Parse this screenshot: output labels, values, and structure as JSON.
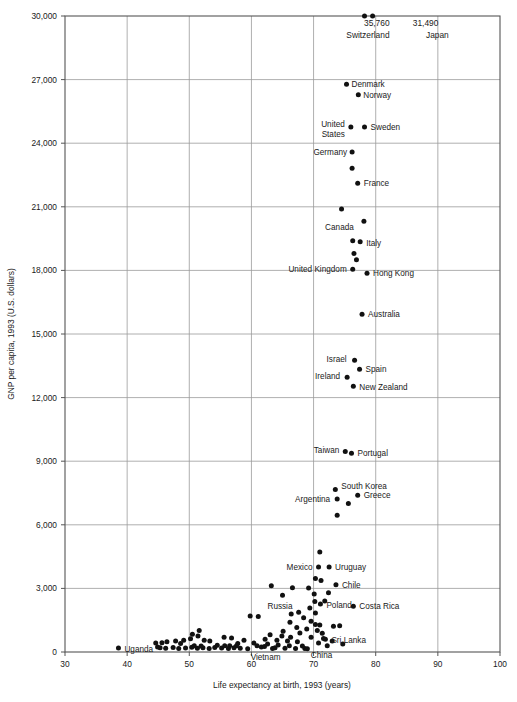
{
  "chart_data": {
    "type": "scatter",
    "title": "",
    "xlabel": "Life expectancy at birth, 1993 (years)",
    "ylabel": "GNP per capita, 1993 (U.S. dollars)",
    "xlim": [
      30,
      100
    ],
    "ylim": [
      0,
      30000
    ],
    "xticks": [
      "30",
      "40",
      "50",
      "60",
      "70",
      "80",
      "90",
      "100"
    ],
    "xtick_values": [
      30,
      40,
      50,
      60,
      70,
      80,
      90,
      100
    ],
    "yticks": [
      "0",
      "3,000",
      "6,000",
      "9,000",
      "12,000",
      "15,000",
      "18,000",
      "21,000",
      "24,000",
      "27,000",
      "30,000"
    ],
    "ytick_values": [
      0,
      3000,
      6000,
      9000,
      12000,
      15000,
      18000,
      21000,
      24000,
      27000,
      30000
    ],
    "grid": true,
    "legend": "none",
    "annotations": [
      {
        "text": "35,760",
        "x": 83.2,
        "y": 30000,
        "anchor": "end",
        "dx": -6,
        "dy": 10
      },
      {
        "text": "Switzerland",
        "x": 83.2,
        "y": 30000,
        "anchor": "end",
        "dx": -6,
        "dy": 22
      },
      {
        "text": "31,490",
        "x": 85.0,
        "y": 30000,
        "anchor": "start",
        "dx": 6,
        "dy": 10
      },
      {
        "text": "Japan",
        "x": 85.0,
        "y": 30000,
        "anchor": "end",
        "dx": 42,
        "dy": 22
      }
    ],
    "labeled_points": [
      {
        "name": "Switzerland",
        "x": 78.2,
        "y": 30000,
        "value": 35760,
        "label": "",
        "anchor": "end",
        "dx": 0,
        "dy": 0
      },
      {
        "name": "Japan",
        "x": 79.5,
        "y": 30000,
        "value": 31490,
        "label": "",
        "anchor": "end",
        "dx": 0,
        "dy": 0
      },
      {
        "name": "Denmark",
        "x": 75.3,
        "y": 26780,
        "label": "Denmark",
        "anchor": "start",
        "dx": 5,
        "dy": 3
      },
      {
        "name": "Norway",
        "x": 77.2,
        "y": 26290,
        "label": "Norway",
        "anchor": "start",
        "dx": 5,
        "dy": 3
      },
      {
        "name": "United States",
        "x": 76.0,
        "y": 24760,
        "label": "United",
        "anchor": "end",
        "dx": -6,
        "dy": 0,
        "label2": "States",
        "dy2": 10
      },
      {
        "name": "Sweden",
        "x": 78.2,
        "y": 24760,
        "label": "Sweden",
        "anchor": "start",
        "dx": 6,
        "dy": 3
      },
      {
        "name": "Germany",
        "x": 76.2,
        "y": 23580,
        "label": "Germany",
        "anchor": "end",
        "dx": -5,
        "dy": 3
      },
      {
        "name": "Germany2",
        "x": 76.2,
        "y": 22820,
        "label": "",
        "anchor": "start",
        "dx": 0,
        "dy": 0
      },
      {
        "name": "France",
        "x": 77.1,
        "y": 22110,
        "label": "France",
        "anchor": "start",
        "dx": 6,
        "dy": 3
      },
      {
        "name": "Unlabeled-21k",
        "x": 74.5,
        "y": 20900,
        "label": "",
        "anchor": "start",
        "dx": 0,
        "dy": 0
      },
      {
        "name": "Unlabeled-20.3k",
        "x": 78.1,
        "y": 20320,
        "label": "",
        "anchor": "start",
        "dx": 0,
        "dy": 0
      },
      {
        "name": "Canada",
        "x": 77.6,
        "y": 19900,
        "label": "Canada",
        "anchor": "end",
        "dx": -7,
        "dy": 0
      },
      {
        "name": "Italy",
        "x": 77.5,
        "y": 19350,
        "label": "Italy",
        "anchor": "start",
        "dx": 6,
        "dy": 4
      },
      {
        "name": "Unlabeled-19.4k",
        "x": 76.3,
        "y": 19400,
        "label": "",
        "anchor": "start",
        "dx": 0,
        "dy": 0
      },
      {
        "name": "Unlabeled-18.9k",
        "x": 76.5,
        "y": 18800,
        "label": "",
        "anchor": "start",
        "dx": 0,
        "dy": 0
      },
      {
        "name": "Unlabeled-18.5k",
        "x": 76.9,
        "y": 18500,
        "label": "",
        "anchor": "start",
        "dx": 0,
        "dy": 0
      },
      {
        "name": "United Kingdom",
        "x": 76.3,
        "y": 18060,
        "label": "United Kingdom",
        "anchor": "end",
        "dx": -6,
        "dy": 3
      },
      {
        "name": "Hong Kong",
        "x": 78.6,
        "y": 17860,
        "label": "Hong Kong",
        "anchor": "start",
        "dx": 6,
        "dy": 3
      },
      {
        "name": "Australia",
        "x": 77.8,
        "y": 15930,
        "label": "Australia",
        "anchor": "start",
        "dx": 6,
        "dy": 3
      },
      {
        "name": "Israel",
        "x": 76.6,
        "y": 13760,
        "label": "Israel",
        "anchor": "end",
        "dx": -8,
        "dy": 2
      },
      {
        "name": "Spain",
        "x": 77.4,
        "y": 13340,
        "label": "Spain",
        "anchor": "start",
        "dx": 6,
        "dy": 3
      },
      {
        "name": "Ireland",
        "x": 75.4,
        "y": 12960,
        "label": "Ireland",
        "anchor": "end",
        "dx": -7,
        "dy": 2
      },
      {
        "name": "New Zealand",
        "x": 76.4,
        "y": 12540,
        "label": "New Zealand",
        "anchor": "start",
        "dx": 6,
        "dy": 4
      },
      {
        "name": "Taiwan",
        "x": 75.1,
        "y": 9460,
        "label": "Taiwan",
        "anchor": "end",
        "dx": -6,
        "dy": 2
      },
      {
        "name": "Portugal",
        "x": 76.1,
        "y": 9370,
        "label": "Portugal",
        "anchor": "start",
        "dx": 6,
        "dy": 3
      },
      {
        "name": "South Korea",
        "x": 73.5,
        "y": 7660,
        "label": "South Korea",
        "anchor": "start",
        "dx": 6,
        "dy": -1
      },
      {
        "name": "Argentina",
        "x": 73.8,
        "y": 7220,
        "label": "Argentina",
        "anchor": "end",
        "dx": -7,
        "dy": 3
      },
      {
        "name": "Greece",
        "x": 77.1,
        "y": 7390,
        "label": "Greece",
        "anchor": "start",
        "dx": 6,
        "dy": 3
      },
      {
        "name": "Unlabeled-7.0k",
        "x": 75.6,
        "y": 7000,
        "label": "",
        "anchor": "start",
        "dx": 0,
        "dy": 0
      },
      {
        "name": "Unlabeled-6.4k",
        "x": 73.8,
        "y": 6450,
        "label": "",
        "anchor": "start",
        "dx": 0,
        "dy": 0
      },
      {
        "name": "Unlabeled-4.7k",
        "x": 71.0,
        "y": 4720,
        "label": "",
        "anchor": "start",
        "dx": 0,
        "dy": 0
      },
      {
        "name": "Mexico",
        "x": 70.8,
        "y": 4010,
        "label": "Mexico",
        "anchor": "end",
        "dx": -6,
        "dy": 3
      },
      {
        "name": "Uruguay",
        "x": 72.5,
        "y": 4010,
        "label": "Uruguay",
        "anchor": "start",
        "dx": 6,
        "dy": 3
      },
      {
        "name": "Chile",
        "x": 73.6,
        "y": 3170,
        "label": "Chile",
        "anchor": "start",
        "dx": 6,
        "dy": 3
      },
      {
        "name": "Russia",
        "x": 65.0,
        "y": 2680,
        "label": "Russia",
        "anchor": "end",
        "dx": 10,
        "dy": 14
      },
      {
        "name": "Poland",
        "x": 71.1,
        "y": 2270,
        "label": "Poland",
        "anchor": "start",
        "dx": 6,
        "dy": 4
      },
      {
        "name": "Costa Rica",
        "x": 76.4,
        "y": 2160,
        "label": "Costa Rica",
        "anchor": "start",
        "dx": 6,
        "dy": 3
      },
      {
        "name": "Sri Lanka",
        "x": 71.9,
        "y": 600,
        "label": "Sri Lanka",
        "anchor": "start",
        "dx": 6,
        "dy": 4
      },
      {
        "name": "Vietnam",
        "x": 63.4,
        "y": 170,
        "label": "Vietnam",
        "anchor": "end",
        "dx": 8,
        "dy": 12
      },
      {
        "name": "China",
        "x": 68.6,
        "y": 170,
        "label": "China",
        "anchor": "start",
        "dx": 6,
        "dy": 10
      },
      {
        "name": "Uganda",
        "x": 38.6,
        "y": 190,
        "label": "Uganda",
        "anchor": "start",
        "dx": 6,
        "dy": 4
      }
    ],
    "unlabeled_points": [
      {
        "x": 78.2,
        "y": 30000
      },
      {
        "x": 79.5,
        "y": 30000
      },
      {
        "x": 75.3,
        "y": 26780
      },
      {
        "x": 77.2,
        "y": 26290
      },
      {
        "x": 76.0,
        "y": 24760
      },
      {
        "x": 78.2,
        "y": 24760
      },
      {
        "x": 76.2,
        "y": 23580
      },
      {
        "x": 76.2,
        "y": 22820
      },
      {
        "x": 77.1,
        "y": 22110
      },
      {
        "x": 74.5,
        "y": 20900
      },
      {
        "x": 78.1,
        "y": 20320
      },
      {
        "x": 77.5,
        "y": 19350
      },
      {
        "x": 76.3,
        "y": 19400
      },
      {
        "x": 76.5,
        "y": 18800
      },
      {
        "x": 76.9,
        "y": 18500
      },
      {
        "x": 76.3,
        "y": 18060
      },
      {
        "x": 78.6,
        "y": 17860
      },
      {
        "x": 77.8,
        "y": 15930
      },
      {
        "x": 76.6,
        "y": 13760
      },
      {
        "x": 77.4,
        "y": 13340
      },
      {
        "x": 75.4,
        "y": 12960
      },
      {
        "x": 76.4,
        "y": 12540
      },
      {
        "x": 75.1,
        "y": 9460
      },
      {
        "x": 76.1,
        "y": 9370
      },
      {
        "x": 73.5,
        "y": 7660
      },
      {
        "x": 73.8,
        "y": 7220
      },
      {
        "x": 77.1,
        "y": 7390
      },
      {
        "x": 75.6,
        "y": 7000
      },
      {
        "x": 73.8,
        "y": 6450
      },
      {
        "x": 71.0,
        "y": 4720
      },
      {
        "x": 70.8,
        "y": 4010
      },
      {
        "x": 72.5,
        "y": 4010
      },
      {
        "x": 73.6,
        "y": 3170
      },
      {
        "x": 65.0,
        "y": 2680
      },
      {
        "x": 71.1,
        "y": 2270
      },
      {
        "x": 76.4,
        "y": 2160
      },
      {
        "x": 71.9,
        "y": 600
      },
      {
        "x": 63.4,
        "y": 170
      },
      {
        "x": 68.6,
        "y": 170
      },
      {
        "x": 38.6,
        "y": 190
      },
      {
        "x": 70.3,
        "y": 3470
      },
      {
        "x": 71.2,
        "y": 3370
      },
      {
        "x": 69.2,
        "y": 3020
      },
      {
        "x": 66.6,
        "y": 3030
      },
      {
        "x": 63.2,
        "y": 3120
      },
      {
        "x": 72.4,
        "y": 2790
      },
      {
        "x": 70.1,
        "y": 2740
      },
      {
        "x": 71.8,
        "y": 2400
      },
      {
        "x": 70.2,
        "y": 2380
      },
      {
        "x": 69.4,
        "y": 2070
      },
      {
        "x": 70.3,
        "y": 1840
      },
      {
        "x": 67.6,
        "y": 1870
      },
      {
        "x": 66.4,
        "y": 1790
      },
      {
        "x": 61.1,
        "y": 1670
      },
      {
        "x": 68.4,
        "y": 1620
      },
      {
        "x": 69.6,
        "y": 1450
      },
      {
        "x": 66.2,
        "y": 1400
      },
      {
        "x": 70.3,
        "y": 1300
      },
      {
        "x": 71.0,
        "y": 1270
      },
      {
        "x": 73.2,
        "y": 1210
      },
      {
        "x": 67.3,
        "y": 1150
      },
      {
        "x": 68.9,
        "y": 1080
      },
      {
        "x": 70.6,
        "y": 1020
      },
      {
        "x": 65.1,
        "y": 980
      },
      {
        "x": 67.8,
        "y": 900
      },
      {
        "x": 71.4,
        "y": 880
      },
      {
        "x": 63.0,
        "y": 810
      },
      {
        "x": 64.9,
        "y": 760
      },
      {
        "x": 66.3,
        "y": 700
      },
      {
        "x": 69.6,
        "y": 690
      },
      {
        "x": 71.6,
        "y": 640
      },
      {
        "x": 62.2,
        "y": 600
      },
      {
        "x": 64.1,
        "y": 560
      },
      {
        "x": 65.8,
        "y": 520
      },
      {
        "x": 67.4,
        "y": 480
      },
      {
        "x": 70.8,
        "y": 420
      },
      {
        "x": 60.4,
        "y": 420
      },
      {
        "x": 62.6,
        "y": 380
      },
      {
        "x": 64.3,
        "y": 330
      },
      {
        "x": 66.1,
        "y": 300
      },
      {
        "x": 68.2,
        "y": 280
      },
      {
        "x": 61.6,
        "y": 240
      },
      {
        "x": 63.8,
        "y": 200
      },
      {
        "x": 65.4,
        "y": 180
      },
      {
        "x": 67.1,
        "y": 160
      },
      {
        "x": 69.0,
        "y": 150
      },
      {
        "x": 59.4,
        "y": 150
      },
      {
        "x": 58.2,
        "y": 180
      },
      {
        "x": 57.2,
        "y": 200
      },
      {
        "x": 56.3,
        "y": 170
      },
      {
        "x": 55.2,
        "y": 190
      },
      {
        "x": 54.1,
        "y": 210
      },
      {
        "x": 53.2,
        "y": 170
      },
      {
        "x": 52.2,
        "y": 200
      },
      {
        "x": 51.3,
        "y": 180
      },
      {
        "x": 50.4,
        "y": 220
      },
      {
        "x": 49.4,
        "y": 190
      },
      {
        "x": 48.3,
        "y": 170
      },
      {
        "x": 47.4,
        "y": 210
      },
      {
        "x": 46.2,
        "y": 180
      },
      {
        "x": 45.3,
        "y": 200
      },
      {
        "x": 44.9,
        "y": 240
      },
      {
        "x": 50.2,
        "y": 620
      },
      {
        "x": 50.5,
        "y": 840
      },
      {
        "x": 51.4,
        "y": 760
      },
      {
        "x": 51.6,
        "y": 1010
      },
      {
        "x": 52.4,
        "y": 560
      },
      {
        "x": 53.3,
        "y": 520
      },
      {
        "x": 55.6,
        "y": 700
      },
      {
        "x": 56.8,
        "y": 660
      },
      {
        "x": 57.8,
        "y": 400
      },
      {
        "x": 56.5,
        "y": 300
      },
      {
        "x": 57.6,
        "y": 290
      },
      {
        "x": 55.7,
        "y": 300
      },
      {
        "x": 54.5,
        "y": 320
      },
      {
        "x": 50.8,
        "y": 300
      },
      {
        "x": 51.9,
        "y": 280
      },
      {
        "x": 49.1,
        "y": 560
      },
      {
        "x": 47.8,
        "y": 520
      },
      {
        "x": 46.4,
        "y": 480
      },
      {
        "x": 45.6,
        "y": 440
      },
      {
        "x": 48.6,
        "y": 400
      },
      {
        "x": 44.6,
        "y": 420
      },
      {
        "x": 59.8,
        "y": 1700
      },
      {
        "x": 58.8,
        "y": 560
      },
      {
        "x": 60.9,
        "y": 300
      },
      {
        "x": 62.1,
        "y": 260
      },
      {
        "x": 74.2,
        "y": 1240
      },
      {
        "x": 73.0,
        "y": 520
      },
      {
        "x": 74.7,
        "y": 380
      },
      {
        "x": 72.2,
        "y": 300
      }
    ]
  },
  "plot_geometry": {
    "left": 65,
    "right": 500,
    "top": 16,
    "bottom": 652
  }
}
